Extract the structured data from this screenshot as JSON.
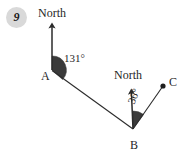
{
  "figure": {
    "question_number": "9",
    "background_color": "#ffffff",
    "stroke_color": "#2b2b2b",
    "sector_fill_color": "#3a3a3a",
    "badge_color": "#d9d9d9",
    "points": [
      {
        "name": "A",
        "label": "A",
        "x": 52,
        "y": 70,
        "dot": false
      },
      {
        "name": "B",
        "label": "B",
        "x": 133,
        "y": 129,
        "dot": false
      },
      {
        "name": "C",
        "label": "C",
        "x": 163,
        "y": 86,
        "dot": true
      }
    ],
    "north_arrows": [
      {
        "at": "A",
        "label": "North",
        "from_x": 52,
        "from_y": 70,
        "to_x": 52,
        "to_y": 21
      },
      {
        "at": "B",
        "label": "North",
        "from_x": 133,
        "from_y": 129,
        "to_x": 131,
        "to_y": 87
      }
    ],
    "segments": [
      {
        "name": "A-to-B",
        "from": "A",
        "to": "B"
      },
      {
        "name": "B-to-C",
        "from": "B",
        "to": "C"
      }
    ],
    "angles": [
      {
        "at": "A",
        "value": "131°",
        "degrees": 131,
        "from": "north",
        "to": "A-to-B",
        "rotated": false
      },
      {
        "at": "B",
        "value": "36°",
        "degrees": 36,
        "from": "north",
        "to": "B-to-C",
        "rotated": true
      }
    ]
  }
}
